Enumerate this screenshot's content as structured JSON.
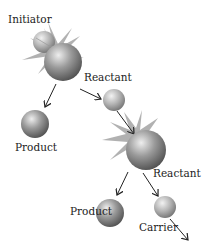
{
  "diagram": {
    "labels": {
      "initiator": "Initiator",
      "reactant_1": "Reactant",
      "product_1": "Product",
      "reactant_2": "Reactant",
      "product_2": "Product",
      "carrier": "Carrier"
    },
    "colors": {
      "sphere_dark": "#5a5a5a",
      "sphere_light": "#e6e6e6",
      "burst": "#a8a8a8",
      "arrow": "#222222",
      "text": "#222222"
    }
  }
}
